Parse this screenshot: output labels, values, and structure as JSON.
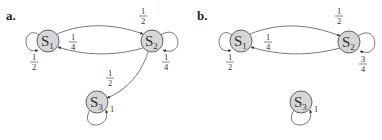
{
  "panels": [
    {
      "label": "a.",
      "states": [
        {
          "name": "S",
          "sub": "1"
        },
        {
          "name": "S",
          "sub": "2"
        },
        {
          "name": "S",
          "sub": "3"
        }
      ],
      "transitions": [
        {
          "from": "S1",
          "to": "S1",
          "num": "1",
          "den": "2"
        },
        {
          "from": "S1",
          "to": "S2",
          "num": "1",
          "den": "2"
        },
        {
          "from": "S2",
          "to": "S1",
          "num": "1",
          "den": "4"
        },
        {
          "from": "S2",
          "to": "S2",
          "num": "1",
          "den": "4"
        },
        {
          "from": "S2",
          "to": "S3",
          "num": "1",
          "den": "2"
        },
        {
          "from": "S3",
          "to": "S3",
          "value": "1"
        }
      ]
    },
    {
      "label": "b.",
      "states": [
        {
          "name": "S",
          "sub": "1"
        },
        {
          "name": "S",
          "sub": "2"
        },
        {
          "name": "S",
          "sub": "3"
        }
      ],
      "transitions": [
        {
          "from": "S1",
          "to": "S1",
          "num": "1",
          "den": "2"
        },
        {
          "from": "S1",
          "to": "S2",
          "num": "1",
          "den": "2"
        },
        {
          "from": "S2",
          "to": "S1",
          "num": "1",
          "den": "4"
        },
        {
          "from": "S2",
          "to": "S2",
          "num": "3",
          "den": "4"
        },
        {
          "from": "S3",
          "to": "S3",
          "value": "1"
        }
      ]
    }
  ]
}
